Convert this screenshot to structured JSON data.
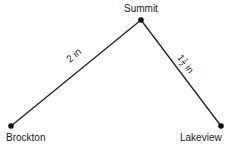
{
  "diagram": {
    "nodes": [
      {
        "name": "Summit",
        "x": 141,
        "y": 20
      },
      {
        "name": "Brockton",
        "x": 11,
        "y": 126
      },
      {
        "name": "Lakeview",
        "x": 221,
        "y": 126
      }
    ],
    "edges": [
      {
        "from": "Brockton",
        "to": "Summit",
        "label": "2 in"
      },
      {
        "from": "Summit",
        "to": "Lakeview",
        "label": "1 1/2 in",
        "whole": "1",
        "numerator": "1",
        "denominator": "2",
        "unit": "in"
      }
    ],
    "colors": {
      "line": "#222222",
      "node": "#111111"
    }
  }
}
